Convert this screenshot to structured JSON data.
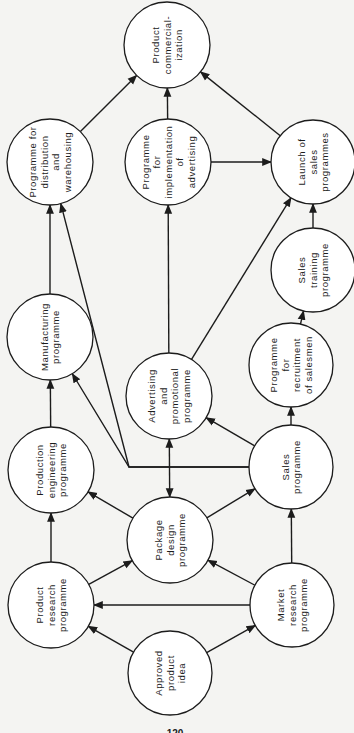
{
  "diagram": {
    "orientation": "rotated-90-ccw",
    "colors": {
      "background": "#f4f4f2",
      "ink": "#1c1c1c",
      "node_fill": "#ffffff"
    },
    "nodes": [
      {
        "id": "commercialization",
        "lines": [
          "Product",
          "commercial-",
          "ization"
        ],
        "x": 167,
        "y": 45,
        "r": 43
      },
      {
        "id": "distribution",
        "lines": [
          "Programme for",
          "distribution",
          "and",
          "warehousing"
        ],
        "x": 50,
        "y": 162,
        "r": 43
      },
      {
        "id": "impl_advertising",
        "lines": [
          "Programme",
          "for",
          "implementation",
          "of",
          "advertising"
        ],
        "x": 168,
        "y": 162,
        "r": 43
      },
      {
        "id": "launch_sales",
        "lines": [
          "Launch of",
          "sales",
          "programmes"
        ],
        "x": 313,
        "y": 162,
        "r": 42
      },
      {
        "id": "manufacturing",
        "lines": [
          "Manufacturing",
          "programme"
        ],
        "x": 50,
        "y": 337,
        "r": 43
      },
      {
        "id": "sales_training",
        "lines": [
          "Sales",
          "training",
          "programme"
        ],
        "x": 313,
        "y": 270,
        "r": 42
      },
      {
        "id": "adv_promo",
        "lines": [
          "Advertising",
          "and",
          "promotional",
          "programme"
        ],
        "x": 169,
        "y": 396,
        "r": 43
      },
      {
        "id": "recruitment",
        "lines": [
          "Programme",
          "for",
          "recruitment",
          "of salesmen"
        ],
        "x": 291,
        "y": 365,
        "r": 42
      },
      {
        "id": "prod_engineering",
        "lines": [
          "Production",
          "engineering",
          "programme"
        ],
        "x": 51,
        "y": 470,
        "r": 43
      },
      {
        "id": "sales",
        "lines": [
          "Sales",
          "programme"
        ],
        "x": 291,
        "y": 467,
        "r": 42
      },
      {
        "id": "package_design",
        "lines": [
          "Package",
          "design",
          "programme"
        ],
        "x": 170,
        "y": 540,
        "r": 43
      },
      {
        "id": "product_research",
        "lines": [
          "Product",
          "research",
          "programme"
        ],
        "x": 51,
        "y": 605,
        "r": 43
      },
      {
        "id": "market_research",
        "lines": [
          "Market",
          "research",
          "programme"
        ],
        "x": 292,
        "y": 605,
        "r": 42
      },
      {
        "id": "approved_idea",
        "lines": [
          "Approved",
          "product",
          "idea"
        ],
        "x": 170,
        "y": 673,
        "r": 42
      }
    ],
    "edges": [
      {
        "from": "approved_idea",
        "to": "product_research"
      },
      {
        "from": "approved_idea",
        "to": "market_research"
      },
      {
        "from": "market_research",
        "to": "product_research"
      },
      {
        "from": "market_research",
        "to": "package_design"
      },
      {
        "from": "market_research",
        "to": "sales"
      },
      {
        "from": "product_research",
        "to": "package_design"
      },
      {
        "from": "product_research",
        "to": "prod_engineering"
      },
      {
        "from": "package_design",
        "to": "prod_engineering"
      },
      {
        "from": "package_design",
        "to": "sales"
      },
      {
        "from": "package_design",
        "to": "adv_promo",
        "bidirectional": true
      },
      {
        "from": "prod_engineering",
        "to": "manufacturing"
      },
      {
        "from": "sales",
        "to": "adv_promo"
      },
      {
        "from": "sales",
        "to": "recruitment"
      },
      {
        "from": "sales",
        "to": "manufacturing",
        "via": [
          [
            129,
            467
          ]
        ]
      },
      {
        "from": "sales",
        "to": "distribution",
        "via": [
          [
            129,
            467
          ]
        ]
      },
      {
        "from": "recruitment",
        "to": "sales_training"
      },
      {
        "from": "sales_training",
        "to": "launch_sales"
      },
      {
        "from": "adv_promo",
        "to": "impl_advertising"
      },
      {
        "from": "adv_promo",
        "to": "launch_sales"
      },
      {
        "from": "impl_advertising",
        "to": "launch_sales"
      },
      {
        "from": "impl_advertising",
        "to": "commercialization"
      },
      {
        "from": "manufacturing",
        "to": "distribution"
      },
      {
        "from": "distribution",
        "to": "commercialization"
      },
      {
        "from": "launch_sales",
        "to": "commercialization"
      }
    ]
  },
  "page": {
    "number": "120",
    "x": 175,
    "y": 733
  }
}
